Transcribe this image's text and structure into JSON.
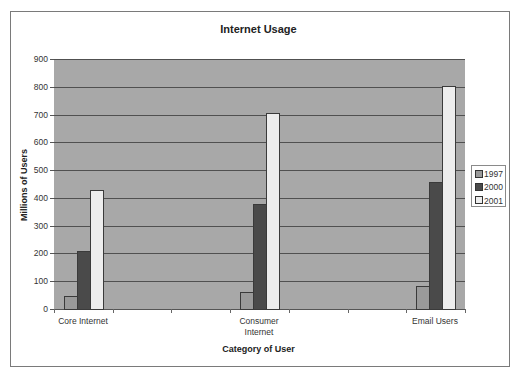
{
  "chart_data": {
    "type": "bar",
    "title": "Internet Usage",
    "xlabel": "Category of User",
    "ylabel": "Millions of Users",
    "categories": [
      "Core Internet",
      "Consumer Internet",
      "Email Users"
    ],
    "series": [
      {
        "name": "1997",
        "values": [
          47,
          60,
          83
        ],
        "color": "#9a9a9a"
      },
      {
        "name": "2000",
        "values": [
          210,
          377,
          456
        ],
        "color": "#4a4a4a"
      },
      {
        "name": "2001",
        "values": [
          428,
          707,
          803
        ],
        "color": "#ededed"
      }
    ],
    "ylim": [
      0,
      900
    ],
    "yticks": [
      0,
      100,
      200,
      300,
      400,
      500,
      600,
      700,
      800,
      900
    ],
    "grid": true,
    "legend_position": "right",
    "plot_background": "#a8a8a8"
  },
  "labels": {
    "title": "Internet Usage",
    "xlabel": "Category of User",
    "ylabel": "Millions of Users",
    "categories": [
      "Core Internet",
      "Consumer\nInternet",
      "Email Users"
    ],
    "legend": [
      "1997",
      "2000",
      "2001"
    ]
  }
}
